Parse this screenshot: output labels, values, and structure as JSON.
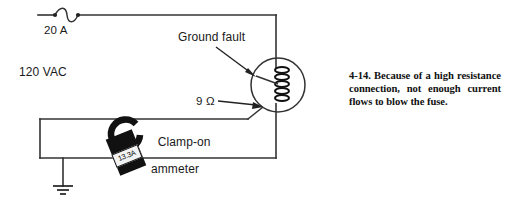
{
  "figure": {
    "caption": "4-14. Because of a high resistance connection, not enough current flows to blow the fuse."
  },
  "circuit": {
    "fuse": {
      "label": "20 A",
      "name": "fuse-symbol"
    },
    "source": {
      "label": "120 VAC"
    },
    "fault_annotation": {
      "label": "Ground fault"
    },
    "resistance_annotation": {
      "label": "9 Ω"
    },
    "load": {
      "name": "motor-winding-coil"
    },
    "ground": {
      "name": "earth-ground-symbol"
    }
  },
  "meter": {
    "label_line1": "Clamp-on",
    "label_line2": "ammeter",
    "reading": "13.3A"
  },
  "colors": {
    "ink": "#1a1a1a",
    "wire": "#333333",
    "meter_body": "#111111",
    "display_bg": "#f2f2f2",
    "page_bg": "#ffffff"
  }
}
